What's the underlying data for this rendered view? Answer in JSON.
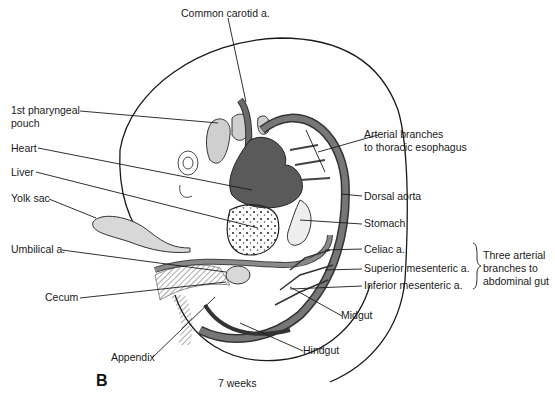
{
  "figure": {
    "panel_letter": "B",
    "caption": "7 weeks",
    "labels": {
      "common_carotid": "Common carotid a.",
      "pharyngeal_pouch_line1": "1st pharyngeal",
      "pharyngeal_pouch_line2": "pouch",
      "heart": "Heart",
      "liver": "Liver",
      "yolk_sac": "Yolk sac",
      "umbilical": "Umbilical a.",
      "cecum": "Cecum",
      "appendix": "Appendix",
      "arterial_branches_line1": "Arterial branches",
      "arterial_branches_line2": "to thoracic esophagus",
      "dorsal_aorta": "Dorsal aorta",
      "stomach": "Stomach",
      "celiac": "Celiac a.",
      "superior_mesenteric": "Superior mesenteric a.",
      "inferior_mesenteric": "Inferior mesenteric a.",
      "midgut": "Midgut",
      "hindgut": "Hindgut",
      "group_line1": "Three arterial",
      "group_line2": "branches to",
      "group_line3": "abdominal gut"
    },
    "colors": {
      "ink": "#1a1a1a",
      "artery_fill": "#5a5a5a",
      "light_tissue": "#d8d8d8",
      "background": "#ffffff"
    }
  }
}
